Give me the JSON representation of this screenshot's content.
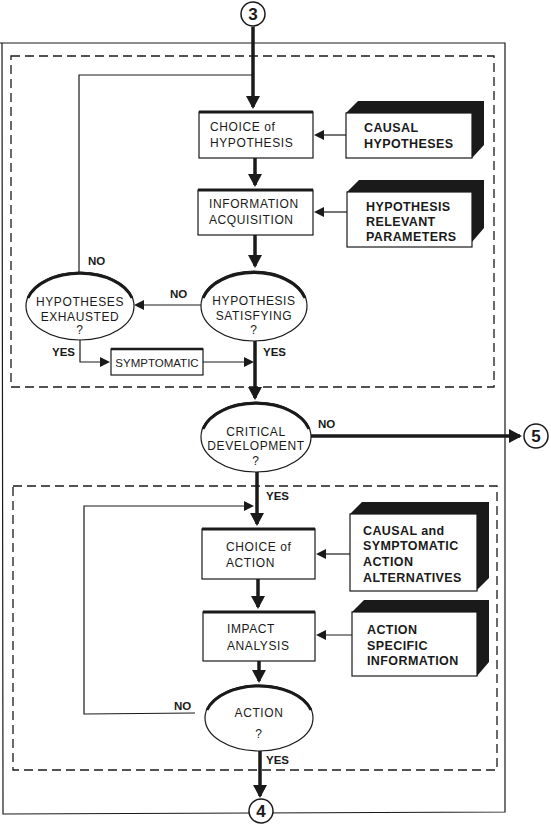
{
  "connectors": {
    "top": "3",
    "right": "5",
    "bottom": "4"
  },
  "hypothesis_section": {
    "choice_of_hypothesis": [
      "CHOICE of",
      "HYPOTHESIS"
    ],
    "information_acquisition": [
      "INFORMATION",
      "ACQUISITION"
    ],
    "causal_hypotheses": [
      "CAUSAL",
      "HYPOTHESES"
    ],
    "hypothesis_relevant_parameters": [
      "HYPOTHESIS",
      "RELEVANT",
      "PARAMETERS"
    ],
    "hypotheses_exhausted": [
      "HYPOTHESES",
      "EXHAUSTED",
      "?"
    ],
    "hypothesis_satisfying": [
      "HYPOTHESIS",
      "SATISFYING",
      "?"
    ],
    "symptomatic": "SYMPTOMATIC",
    "labels": {
      "no_loop": "NO",
      "no_satisfying": "NO",
      "yes_exhausted": "YES",
      "yes_satisfying": "YES"
    }
  },
  "critical_development": {
    "text": [
      "CRITICAL",
      "DEVELOPMENT",
      "?"
    ],
    "no_label": "NO",
    "yes_label": "YES"
  },
  "action_section": {
    "choice_of_action": [
      "CHOICE of",
      "ACTION"
    ],
    "impact_analysis": [
      "IMPACT",
      "ANALYSIS"
    ],
    "action_alternatives": [
      "CAUSAL and",
      "SYMPTOMATIC",
      "ACTION",
      "ALTERNATIVES"
    ],
    "action_specific_information": [
      "ACTION",
      "SPECIFIC",
      "INFORMATION"
    ],
    "action_decision": [
      "ACTION",
      "?"
    ],
    "labels": {
      "no_action": "NO",
      "yes_action": "YES"
    }
  },
  "colors": {
    "ink": "#1a1a1a",
    "paper": "#ffffff"
  }
}
